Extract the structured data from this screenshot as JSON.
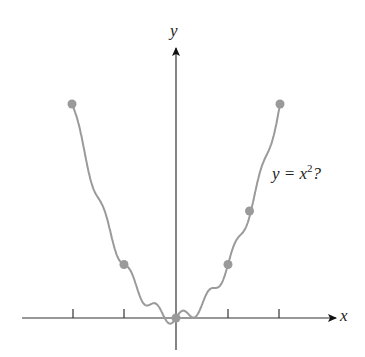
{
  "chart_data": {
    "type": "line",
    "title": "",
    "xlabel": "x",
    "ylabel": "y",
    "annotation": "y = x²?",
    "x_ticks": [
      -2,
      -1,
      1,
      2
    ],
    "tick_labels_shown": false,
    "grid": false,
    "series": [
      {
        "name": "wiggly curve through sample points of y = x^2",
        "color": "#9a9a9a"
      }
    ],
    "points": [
      {
        "x": -2,
        "y": 4
      },
      {
        "x": -1,
        "y": 1
      },
      {
        "x": 0,
        "y": 0
      },
      {
        "x": 1,
        "y": 1
      },
      {
        "x": 1.414,
        "y": 2
      },
      {
        "x": 2,
        "y": 4
      }
    ],
    "xlim": [
      -3,
      3.2
    ],
    "ylim": [
      -0.6,
      5.3
    ]
  },
  "labels": {
    "x_axis": "x",
    "y_axis": "y",
    "equation_prefix": "y = x",
    "equation_exp": "2",
    "equation_suffix": "?"
  },
  "colors": {
    "curve": "#9a9a9a",
    "axes": "#222222",
    "points": "#999999"
  }
}
